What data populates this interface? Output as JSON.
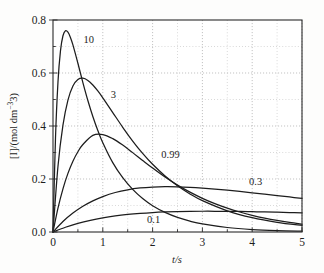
{
  "chart_data": {
    "type": "line",
    "title": "",
    "xlabel": "t/s",
    "ylabel": "[I]/(mol dm−3)",
    "xlim": [
      0,
      5
    ],
    "ylim": [
      0,
      0.8
    ],
    "xticks": [
      "0",
      "1",
      "2",
      "3",
      "4",
      "5"
    ],
    "xtick_values": [
      0,
      1,
      2,
      3,
      4,
      5
    ],
    "yticks": [
      "0.0",
      "0.2",
      "0.4",
      "0.6",
      "0.8"
    ],
    "ytick_values": [
      0.0,
      0.2,
      0.4,
      0.6,
      0.8
    ],
    "x_minor_step": 0.5,
    "y_minor_step": 0.1,
    "grid": "dotted-gray-major-and-minor",
    "legend_position": "inline-curve-labels",
    "line_color": "#1d1d1d",
    "grid_color": "#b7b7b7",
    "axis_color": "#2a2a2a",
    "background": "#fdfdfc",
    "series": [
      {
        "name": "10",
        "label": "10",
        "label_x": 0.72,
        "label_y": 0.715,
        "peak_t": 0.256,
        "peak_value": 0.775,
        "x": [
          0,
          0.05,
          0.1,
          0.15,
          0.2,
          0.25,
          0.3,
          0.35,
          0.4,
          0.5,
          0.6,
          0.7,
          0.8,
          0.9,
          1.0,
          1.2,
          1.4,
          1.6,
          1.8,
          2.0,
          2.25,
          2.5,
          2.75,
          3.0,
          3.5,
          4.0,
          4.5,
          5.0
        ],
        "y": [
          0,
          0.3541,
          0.5661,
          0.6837,
          0.7406,
          0.7595,
          0.7542,
          0.7343,
          0.706,
          0.6367,
          0.564,
          0.4964,
          0.436,
          0.383,
          0.337,
          0.2618,
          0.2048,
          0.1607,
          0.1263,
          0.0993,
          0.0739,
          0.055,
          0.041,
          0.0305,
          0.017,
          0.0094,
          0.0052,
          0.0029
        ]
      },
      {
        "name": "3",
        "label": "3",
        "label_x": 1.21,
        "label_y": 0.505,
        "peak_t": 0.549,
        "peak_value": 0.578,
        "x": [
          0,
          0.1,
          0.2,
          0.3,
          0.4,
          0.5,
          0.6,
          0.7,
          0.8,
          0.9,
          1.0,
          1.2,
          1.4,
          1.6,
          1.8,
          2.0,
          2.25,
          2.5,
          2.75,
          3.0,
          3.5,
          4.0,
          4.5,
          5.0
        ],
        "y": [
          0,
          0.248,
          0.4031,
          0.4976,
          0.5508,
          0.5754,
          0.5803,
          0.5719,
          0.5548,
          0.5321,
          0.5063,
          0.4508,
          0.3952,
          0.3433,
          0.2966,
          0.2555,
          0.2114,
          0.1745,
          0.1437,
          0.1182,
          0.08,
          0.0541,
          0.0365,
          0.0246
        ]
      },
      {
        "name": "0.99",
        "label": "0.99",
        "label_x": 2.36,
        "label_y": 0.278,
        "peak_t": 1.005,
        "peak_value": 0.368,
        "x": [
          0,
          0.1,
          0.2,
          0.3,
          0.4,
          0.5,
          0.6,
          0.8,
          1.0,
          1.2,
          1.4,
          1.6,
          1.8,
          2.0,
          2.25,
          2.5,
          2.75,
          3.0,
          3.25,
          3.5,
          3.75,
          4.0,
          4.25,
          4.5,
          4.75,
          5.0
        ],
        "y": [
          0,
          0.0902,
          0.163,
          0.2211,
          0.2671,
          0.3029,
          0.3301,
          0.3646,
          0.3679,
          0.3525,
          0.328,
          0.2995,
          0.27,
          0.2412,
          0.2072,
          0.1769,
          0.1503,
          0.1271,
          0.1071,
          0.09,
          0.0754,
          0.0629,
          0.0524,
          0.0435,
          0.036,
          0.0298
        ]
      },
      {
        "name": "0.3",
        "label": "0.3",
        "label_x": 4.07,
        "label_y": 0.176,
        "peak_t": 1.72,
        "peak_value": 0.186,
        "x": [
          0,
          0.2,
          0.4,
          0.6,
          0.8,
          1.0,
          1.25,
          1.5,
          1.75,
          2.0,
          2.25,
          2.5,
          2.75,
          3.0,
          3.25,
          3.5,
          3.75,
          4.0,
          4.25,
          4.5,
          4.75,
          5.0
        ],
        "y": [
          0,
          0.0395,
          0.0714,
          0.0971,
          0.1176,
          0.1338,
          0.149,
          0.1594,
          0.1661,
          0.1697,
          0.171,
          0.1705,
          0.1686,
          0.1656,
          0.1619,
          0.1576,
          0.1529,
          0.1479,
          0.1427,
          0.1374,
          0.1321,
          0.1268
        ]
      },
      {
        "name": "0.1",
        "label": "0.1",
        "label_x": 2.02,
        "label_y": 0.035,
        "peak_t": 2.56,
        "peak_value": 0.086,
        "x": [
          0,
          0.25,
          0.5,
          0.75,
          1.0,
          1.25,
          1.5,
          1.75,
          2.0,
          2.25,
          2.5,
          2.75,
          3.0,
          3.25,
          3.5,
          3.75,
          4.0,
          4.25,
          4.5,
          4.75,
          5.0
        ],
        "y": [
          0,
          0.018,
          0.0325,
          0.0441,
          0.0533,
          0.0605,
          0.0661,
          0.0703,
          0.0734,
          0.0756,
          0.077,
          0.0779,
          0.0783,
          0.0783,
          0.078,
          0.0775,
          0.0767,
          0.0758,
          0.0747,
          0.0735,
          0.0722
        ]
      }
    ]
  }
}
